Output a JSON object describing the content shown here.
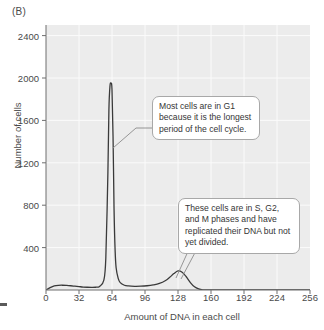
{
  "figure": {
    "panel_label": "(B)",
    "background_color": "#ffffff"
  },
  "chart_data": {
    "type": "line",
    "title": "",
    "subtitle": "",
    "xlabel": "Amount of DNA in each cell",
    "ylabel": "Number of cells",
    "xlim": [
      0,
      256
    ],
    "ylim": [
      0,
      2500
    ],
    "xticks": [
      0,
      32,
      64,
      96,
      128,
      160,
      192,
      224,
      256
    ],
    "yticks": [
      400,
      800,
      1200,
      1600,
      2000,
      2400
    ],
    "grid": true,
    "legend": "none",
    "plot_background_color": "#ececec",
    "grid_color": "#fbfbfb",
    "line_color": "#3a3a3a",
    "series": [
      {
        "name": "Cell count by DNA content",
        "x": [
          0,
          4,
          8,
          12,
          16,
          20,
          24,
          28,
          32,
          36,
          40,
          44,
          48,
          52,
          56,
          58,
          60,
          61,
          62,
          63,
          64,
          65,
          66,
          67,
          68,
          70,
          72,
          76,
          80,
          86,
          92,
          98,
          104,
          110,
          116,
          120,
          124,
          128,
          132,
          136,
          140,
          144,
          148,
          152,
          160,
          176,
          192,
          208,
          224,
          240,
          256
        ],
        "values": [
          0,
          22,
          38,
          44,
          45,
          43,
          40,
          36,
          32,
          28,
          26,
          25,
          26,
          34,
          90,
          300,
          1100,
          1700,
          1920,
          1950,
          1890,
          1450,
          760,
          380,
          210,
          110,
          70,
          45,
          38,
          35,
          36,
          40,
          48,
          62,
          90,
          120,
          155,
          180,
          168,
          125,
          70,
          30,
          10,
          2,
          0,
          0,
          0,
          0,
          0,
          0,
          0
        ]
      }
    ],
    "annotations": [
      {
        "id": "g1-callout",
        "text": "Most cells are in G1 because it is the longest period of the cell cycle.",
        "points_to_x": 66,
        "points_to_y": 1400
      },
      {
        "id": "s-g2-m-callout",
        "text": "These cells are in S, G2, and M phases and have replicated their DNA but not yet divided.",
        "points_to_x": 130,
        "points_to_y": 180
      }
    ]
  }
}
